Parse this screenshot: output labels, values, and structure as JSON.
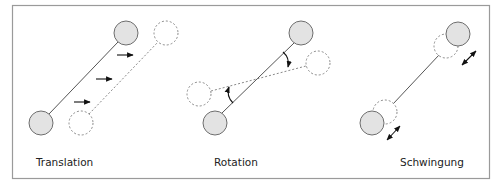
{
  "figure": {
    "frame": {
      "x": 12.5,
      "y": 5.5,
      "width": 477,
      "height": 173,
      "stroke": "#9a9a9a"
    },
    "colors": {
      "ball_fill": "#e3e3e3",
      "ball_stroke": "#6e6e6e",
      "dashed_stroke": "#8a8a8a",
      "line_stroke": "#555555",
      "arrow": "#111111",
      "text": "#222222"
    },
    "panels": [
      {
        "id": "translation",
        "label": "Translation",
        "label_pos": {
          "x": 36,
          "y": 166
        },
        "solid_balls": [
          {
            "cx": 41,
            "cy": 123,
            "r": 12
          },
          {
            "cx": 126,
            "cy": 33,
            "r": 12
          }
        ],
        "dashed_balls": [
          {
            "cx": 81,
            "cy": 123,
            "r": 12
          },
          {
            "cx": 166,
            "cy": 33,
            "r": 12
          }
        ],
        "arrows": [
          {
            "x1": 117,
            "y1": 55,
            "x2": 133,
            "y2": 55
          },
          {
            "x1": 96,
            "y1": 79,
            "x2": 112,
            "y2": 79
          },
          {
            "x1": 74,
            "y1": 102,
            "x2": 90,
            "y2": 102
          }
        ]
      },
      {
        "id": "rotation",
        "label": "Rotation",
        "label_pos": {
          "x": 214,
          "y": 166
        },
        "solid_balls": [
          {
            "cx": 215,
            "cy": 123,
            "r": 12
          },
          {
            "cx": 301,
            "cy": 33,
            "r": 12
          }
        ],
        "dashed_balls": [
          {
            "cx": 199,
            "cy": 94,
            "r": 12
          },
          {
            "cx": 318,
            "cy": 63,
            "r": 12
          }
        ]
      },
      {
        "id": "schwingung",
        "label": "Schwingung",
        "label_pos": {
          "x": 400,
          "y": 166
        },
        "solid_balls": [
          {
            "cx": 372,
            "cy": 123,
            "r": 12
          },
          {
            "cx": 458,
            "cy": 34,
            "r": 12
          }
        ],
        "dashed_balls": [
          {
            "cx": 385,
            "cy": 112,
            "r": 12
          },
          {
            "cx": 446,
            "cy": 46,
            "r": 12
          }
        ],
        "double_arrows": [
          {
            "x1": 387,
            "y1": 140,
            "x2": 400,
            "y2": 126
          },
          {
            "x1": 462,
            "y1": 65,
            "x2": 476,
            "y2": 51
          }
        ]
      }
    ]
  }
}
